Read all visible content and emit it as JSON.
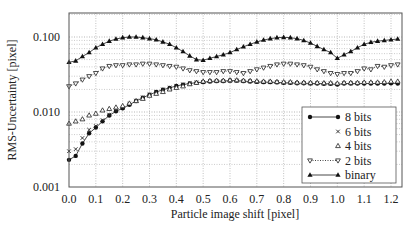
{
  "chart_data": {
    "type": "line",
    "title": "",
    "xlabel": "Particle image shift [pixel]",
    "ylabel": "RMS-Uncertainty [pixel]",
    "xscale": "linear",
    "yscale": "log",
    "xlim": [
      0.0,
      1.25
    ],
    "ylim": [
      0.001,
      0.2
    ],
    "xticks": [
      "0.0",
      "0.1",
      "0.2",
      "0.3",
      "0.4",
      "0.5",
      "0.6",
      "0.7",
      "0.8",
      "0.9",
      "1.0",
      "1.1",
      "1.2"
    ],
    "yticks": [
      "0.001",
      "0.010",
      "0.100"
    ],
    "grid": true,
    "legend_position": "lower right (inside)",
    "x": [
      0.0,
      0.025,
      0.05,
      0.075,
      0.1,
      0.125,
      0.15,
      0.175,
      0.2,
      0.225,
      0.25,
      0.275,
      0.3,
      0.325,
      0.35,
      0.375,
      0.4,
      0.425,
      0.45,
      0.475,
      0.5,
      0.525,
      0.55,
      0.575,
      0.6,
      0.625,
      0.65,
      0.675,
      0.7,
      0.725,
      0.75,
      0.775,
      0.8,
      0.825,
      0.85,
      0.875,
      0.9,
      0.925,
      0.95,
      0.975,
      1.0,
      1.025,
      1.05,
      1.075,
      1.1,
      1.125,
      1.15,
      1.175,
      1.2,
      1.225
    ],
    "series": [
      {
        "name": "8 bits",
        "marker": "filled-circle",
        "line": "solid",
        "values": [
          0.0023,
          0.0026,
          0.0038,
          0.0052,
          0.0062,
          0.0075,
          0.009,
          0.0102,
          0.0112,
          0.0125,
          0.014,
          0.0155,
          0.017,
          0.0185,
          0.0198,
          0.021,
          0.0222,
          0.0232,
          0.024,
          0.0246,
          0.025,
          0.0255,
          0.0258,
          0.0258,
          0.0262,
          0.0262,
          0.0258,
          0.0255,
          0.0252,
          0.025,
          0.025,
          0.0248,
          0.0245,
          0.0245,
          0.0242,
          0.0242,
          0.024,
          0.024,
          0.0238,
          0.0238,
          0.0232,
          0.024,
          0.024,
          0.024,
          0.024,
          0.024,
          0.024,
          0.024,
          0.0242,
          0.024
        ]
      },
      {
        "name": "6 bits",
        "marker": "x",
        "line": "none",
        "values": [
          0.003,
          0.0032,
          0.0045,
          0.0058,
          0.0065,
          0.0078,
          0.0092,
          0.0104,
          0.0114,
          0.0128,
          0.0142,
          0.0157,
          0.0172,
          0.0186,
          0.02,
          0.0212,
          0.0224,
          0.0234,
          0.0242,
          0.0248,
          0.0252,
          0.0257,
          0.026,
          0.026,
          0.0263,
          0.0263,
          0.026,
          0.0257,
          0.0254,
          0.0252,
          0.0252,
          0.025,
          0.0247,
          0.0247,
          0.0244,
          0.0244,
          0.0242,
          0.0242,
          0.024,
          0.024,
          0.0235,
          0.0242,
          0.0242,
          0.0242,
          0.0243,
          0.0243,
          0.0243,
          0.0243,
          0.0245,
          0.0243
        ]
      },
      {
        "name": "4 bits",
        "marker": "open-triangle-up",
        "line": "none",
        "values": [
          0.007,
          0.0075,
          0.008,
          0.009,
          0.0095,
          0.0105,
          0.011,
          0.0115,
          0.012,
          0.013,
          0.014,
          0.015,
          0.0165,
          0.0175,
          0.0185,
          0.02,
          0.021,
          0.022,
          0.0235,
          0.0245,
          0.0255,
          0.026,
          0.0262,
          0.0262,
          0.0265,
          0.0265,
          0.0262,
          0.026,
          0.0257,
          0.0255,
          0.0255,
          0.0252,
          0.025,
          0.025,
          0.0247,
          0.0247,
          0.0245,
          0.0245,
          0.0243,
          0.0243,
          0.024,
          0.0245,
          0.0245,
          0.0245,
          0.0248,
          0.0248,
          0.0248,
          0.025,
          0.0255,
          0.0255
        ]
      },
      {
        "name": "2 bits",
        "marker": "open-triangle-down",
        "line": "dotted",
        "values": [
          0.022,
          0.024,
          0.027,
          0.03,
          0.033,
          0.038,
          0.041,
          0.042,
          0.042,
          0.043,
          0.043,
          0.044,
          0.044,
          0.043,
          0.042,
          0.041,
          0.04,
          0.038,
          0.036,
          0.035,
          0.034,
          0.034,
          0.034,
          0.035,
          0.035,
          0.034,
          0.033,
          0.035,
          0.037,
          0.039,
          0.041,
          0.043,
          0.044,
          0.044,
          0.043,
          0.042,
          0.04,
          0.037,
          0.035,
          0.033,
          0.032,
          0.033,
          0.033,
          0.035,
          0.038,
          0.037,
          0.041,
          0.04,
          0.042,
          0.043
        ]
      },
      {
        "name": "binary",
        "marker": "filled-triangle-up",
        "line": "solid",
        "values": [
          0.046,
          0.048,
          0.055,
          0.062,
          0.072,
          0.08,
          0.088,
          0.094,
          0.098,
          0.1,
          0.1,
          0.098,
          0.095,
          0.092,
          0.086,
          0.08,
          0.072,
          0.064,
          0.056,
          0.05,
          0.049,
          0.052,
          0.055,
          0.058,
          0.062,
          0.068,
          0.074,
          0.08,
          0.086,
          0.091,
          0.095,
          0.098,
          0.099,
          0.098,
          0.095,
          0.09,
          0.083,
          0.075,
          0.068,
          0.062,
          0.052,
          0.058,
          0.064,
          0.072,
          0.08,
          0.085,
          0.088,
          0.09,
          0.092,
          0.094
        ]
      }
    ]
  }
}
